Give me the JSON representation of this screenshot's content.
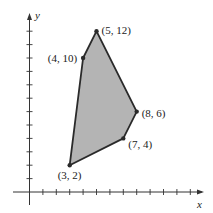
{
  "chart_data": {
    "type": "scatter",
    "subtype": "polygon-region",
    "title": "",
    "xlabel": "x",
    "ylabel": "y",
    "xlim": [
      0,
      13
    ],
    "ylim": [
      0,
      13
    ],
    "grid": false,
    "x_ticks": [
      1,
      2,
      3,
      4,
      5,
      6,
      7,
      8,
      9,
      10,
      11,
      12
    ],
    "y_ticks": [
      1,
      2,
      3,
      4,
      5,
      6,
      7,
      8,
      9,
      10,
      11,
      12
    ],
    "vertices": [
      {
        "x": 3,
        "y": 2,
        "label": "(3, 2)"
      },
      {
        "x": 4,
        "y": 10,
        "label": "(4, 10)"
      },
      {
        "x": 5,
        "y": 12,
        "label": "(5, 12)"
      },
      {
        "x": 8,
        "y": 6,
        "label": "(8, 6)"
      },
      {
        "x": 7,
        "y": 4,
        "label": "(7, 4)"
      }
    ],
    "fill_color": "#b4b4b4",
    "stroke_color": "#2a2a2a"
  }
}
